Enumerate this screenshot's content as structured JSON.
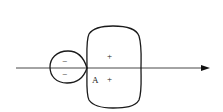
{
  "diagram": {
    "type": "orbital-lobes",
    "axis": {
      "direction": "right",
      "has_arrow": true
    },
    "small_lobe": {
      "signs": [
        "−",
        "−"
      ]
    },
    "large_lobe": {
      "signs": [
        "+",
        "+"
      ]
    },
    "point_label": "A",
    "colors": {
      "stroke": "#1a1a1a",
      "background": "#ffffff"
    }
  }
}
